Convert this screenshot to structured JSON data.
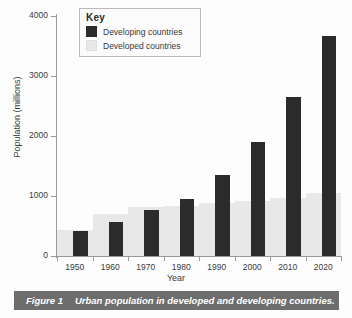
{
  "figure": {
    "caption_number": "Figure 1",
    "caption_text": "Urban population in developed and developing countries."
  },
  "legend": {
    "title": "Key",
    "position": "top-left-inside",
    "entries": [
      {
        "label": "Developing countries",
        "color": "#2b2b2b",
        "swatch": "dark"
      },
      {
        "label": "Developed countries",
        "color": "#e8e8e8",
        "swatch": "light"
      }
    ]
  },
  "chart_data": {
    "type": "bar",
    "title": "",
    "subtitle": "",
    "xlabel": "Year",
    "ylabel": "Population (millions)",
    "categories": [
      "1950",
      "1960",
      "1970",
      "1980",
      "1990",
      "2000",
      "2010",
      "2020"
    ],
    "series": [
      {
        "name": "Developed countries",
        "color": "#e8e8e8",
        "values": [
          440,
          700,
          820,
          830,
          880,
          910,
          960,
          1050
        ]
      },
      {
        "name": "Developing countries",
        "color": "#2b2b2b",
        "values": [
          420,
          560,
          770,
          950,
          1350,
          1900,
          2650,
          3670
        ]
      }
    ],
    "ylim": [
      0,
      4000
    ],
    "yticks": [
      0,
      1000,
      2000,
      3000,
      4000
    ],
    "ytick_labels": [
      "0",
      "1000",
      "2000",
      "3000",
      "4000"
    ],
    "grid": false,
    "legend_position": "upper left"
  },
  "colors": {
    "developing": "#2b2b2b",
    "developed": "#e8e8e8",
    "axis": "#9a9a9a",
    "text": "#3a3a3a",
    "caption_bar": "#6d6d6d",
    "caption_text": "#ffffff",
    "background": "#fdfdfd"
  }
}
